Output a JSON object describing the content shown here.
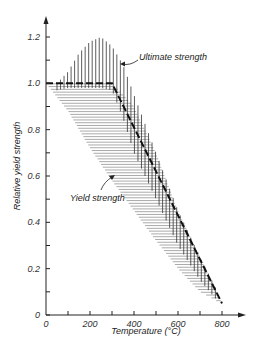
{
  "chart_data": {
    "type": "line",
    "title": "",
    "xlabel": "Temperature (°C)",
    "ylabel": "Relative yield strength",
    "xlim": [
      0,
      800
    ],
    "ylim": [
      0,
      1.2
    ],
    "x_ticks": [
      0,
      100,
      200,
      300,
      400,
      500,
      600,
      700,
      800
    ],
    "x_tick_labels": [
      "0",
      "200",
      "400",
      "600",
      "800"
    ],
    "y_ticks": [
      0,
      0.1,
      0.2,
      0.3,
      0.4,
      0.5,
      0.6,
      0.7,
      0.8,
      0.9,
      1.0,
      1.1,
      1.2
    ],
    "y_tick_labels": [
      "0",
      "0.2",
      "0.4",
      "0.6",
      "0.8",
      "1.0",
      "1.2"
    ],
    "grid": false,
    "series": [
      {
        "name": "Design curve (dashed)",
        "x": [
          0,
          300,
          800
        ],
        "y": [
          1.0,
          1.0,
          0.05
        ]
      }
    ],
    "bands": [
      {
        "name": "Ultimate strength",
        "hatch": "vertical",
        "x": [
          50,
          100,
          150,
          200,
          250,
          300,
          350,
          400,
          500,
          600,
          700,
          780
        ],
        "upper": [
          1.0,
          1.05,
          1.13,
          1.18,
          1.2,
          1.16,
          1.08,
          0.95,
          0.7,
          0.45,
          0.25,
          0.1
        ],
        "lower": [
          0.97,
          0.98,
          0.98,
          0.98,
          0.98,
          0.97,
          0.85,
          0.7,
          0.5,
          0.3,
          0.15,
          0.06
        ]
      },
      {
        "name": "Yield strength",
        "hatch": "horizontal",
        "x": [
          0,
          100,
          200,
          300,
          400,
          500,
          600,
          700,
          800
        ],
        "upper": [
          1.0,
          1.0,
          1.0,
          1.0,
          0.9,
          0.7,
          0.45,
          0.25,
          0.05
        ],
        "lower": [
          1.0,
          0.88,
          0.72,
          0.58,
          0.45,
          0.32,
          0.2,
          0.1,
          0.05
        ]
      }
    ],
    "annotations": [
      "Ultimate strength",
      "Yield strength"
    ]
  },
  "labels": {
    "x_title": "Temperature (°C)",
    "y_title": "Relative yield strength",
    "ultimate": "Ultimate strength",
    "yield": "Yield strength"
  }
}
